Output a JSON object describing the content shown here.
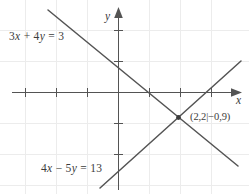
{
  "figure": {
    "type": "coordinate-plane-diagram",
    "background_color": "#ffffff",
    "stroke_color": "#545454",
    "grid_color": "#ebebeb",
    "text_color": "#3c3c3c"
  },
  "axes": {
    "x": {
      "label": "x",
      "arrow": "right",
      "tick_count": 7
    },
    "y": {
      "label": "y",
      "arrow": "up",
      "tick_count": 5
    }
  },
  "labels": {
    "equation_1": "3x + 4y = 3",
    "equation_1_parts": {
      "coef_x": "3",
      "var_x": "x",
      "op": "+",
      "coef_y": "4",
      "var_y": "y",
      "equals": "=",
      "rhs": "3"
    },
    "equation_2": "4x − 5y = 13",
    "equation_2_parts": {
      "coef_x": "4",
      "var_x": "x",
      "op": "−",
      "coef_y": "5",
      "var_y": "y",
      "equals": "=",
      "rhs": "13"
    },
    "intersection_point": "(2,2|−0,9)"
  },
  "chart_data": {
    "type": "line",
    "title": "",
    "xlabel": "x",
    "ylabel": "y",
    "grid": true,
    "legend": "none",
    "xlim": [
      -3.8,
      3.7
    ],
    "ylim": [
      -2.5,
      2.5
    ],
    "xticks": [
      -3,
      -2,
      -1,
      1,
      2,
      3
    ],
    "yticks": [
      -2,
      -1,
      1,
      2
    ],
    "series": [
      {
        "name": "3x + 4y = 3",
        "equation": "3x + 4y = 3",
        "slope": -0.75,
        "intercept": 0.75,
        "x_intercept": 1,
        "y_intercept": 0.75,
        "points": [
          [
            -2.25,
            2.44
          ],
          [
            3.85,
            -2.14
          ]
        ],
        "label_text": "3x + 4y = 3"
      },
      {
        "name": "4x − 5y = 13",
        "equation": "4x − 5y = 13",
        "slope": 0.8,
        "intercept": -2.6,
        "x_intercept": 3.25,
        "y_intercept": -2.6,
        "points": [
          [
            -0.58,
            -3.07
          ],
          [
            3.94,
            0.54
          ]
        ],
        "label_text": "4x − 5y = 13"
      }
    ],
    "annotations": [
      {
        "name": "intersection",
        "text": "(2,2|−0,9)",
        "x": 2.2,
        "y": -0.9,
        "marker": "dot"
      }
    ]
  }
}
